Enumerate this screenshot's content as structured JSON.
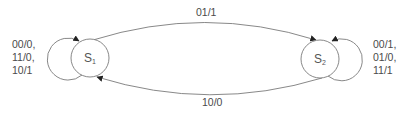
{
  "diagram": {
    "type": "state-machine",
    "colors": {
      "stroke": "#7a7a7a",
      "text": "#4a4a4a",
      "arrow": "#222222"
    },
    "states": [
      {
        "id": "S1",
        "letter": "S",
        "subscript": "1"
      },
      {
        "id": "S2",
        "letter": "S",
        "subscript": "2"
      }
    ],
    "transitions": [
      {
        "from": "S1",
        "to": "S2",
        "label": "01/1"
      },
      {
        "from": "S2",
        "to": "S1",
        "label": "10/0"
      },
      {
        "from": "S1",
        "to": "S1",
        "lines": [
          "00/0,",
          "11/0,",
          "10/1"
        ]
      },
      {
        "from": "S2",
        "to": "S2",
        "lines": [
          "00/1,",
          "01/0,",
          "11/1"
        ]
      }
    ]
  }
}
